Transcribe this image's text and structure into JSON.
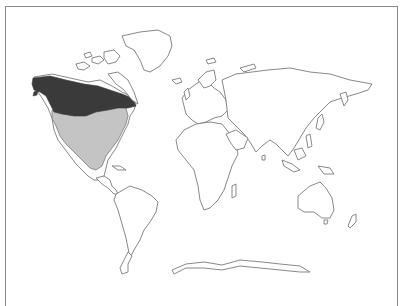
{
  "map": {
    "type": "species-range-map",
    "projection": "world outline",
    "legend_visible": false,
    "colors": {
      "background": "#ffffff",
      "coastline": "#7a7a7a",
      "range_primary": "#3a3a3a",
      "range_secondary": "#c4c4c4",
      "frame": "#8a8a8a"
    },
    "regions": [
      {
        "name": "northern-range",
        "area": "Alaska, Canada (boreal belt)",
        "shade": "dark"
      },
      {
        "name": "southern-range",
        "area": "United States and Mexico",
        "shade": "light"
      }
    ]
  }
}
